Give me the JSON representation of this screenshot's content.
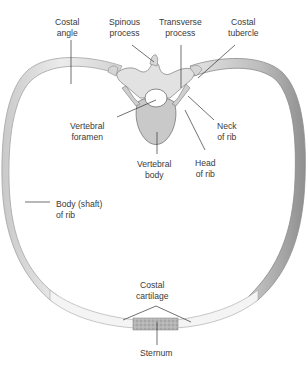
{
  "diagram": {
    "labels": {
      "costal_angle": {
        "line1": "Costal",
        "line2": "angle"
      },
      "spinous_process": {
        "line1": "Spinous",
        "line2": "process"
      },
      "transverse_process": {
        "line1": "Transverse",
        "line2": "process"
      },
      "costal_tubercle": {
        "line1": "Costal",
        "line2": "tubercle"
      },
      "vertebral_foramen": {
        "line1": "Vertebral",
        "line2": "foramen"
      },
      "vertebral_body": {
        "line1": "Vertebral",
        "line2": "body"
      },
      "neck_of_rib": {
        "line1": "Neck",
        "line2": "of rib"
      },
      "head_of_rib": {
        "line1": "Head",
        "line2": "of rib"
      },
      "body_shaft_of_rib": {
        "line1": "Body (shaft)",
        "line2": "of rib"
      },
      "costal_cartilage": {
        "line1": "Costal",
        "line2": "cartilage"
      },
      "sternum": {
        "line1": "Sternum"
      }
    },
    "colors": {
      "bone_fill": "#e6e6e6",
      "bone_edge": "#9a9a9a",
      "bone_shade": "#bdbdbd",
      "cartilage_fill": "#f3f3f3",
      "sternum_fill": "#b8b8b8",
      "leader_line": "#333333",
      "label_text": "#3a3a3a"
    }
  }
}
